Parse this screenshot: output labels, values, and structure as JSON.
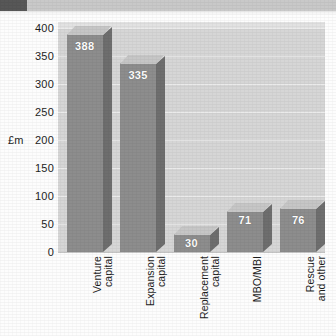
{
  "scan": {
    "band_present": true,
    "band_dark_swatch": "#575757",
    "band_light_swatch": "#c9c9c9"
  },
  "colors": {
    "bar_front": "#8d8d8d",
    "bar_top": "#c6c6c6",
    "bar_side": "#6e6e6e",
    "plot_background": "#d6d6d6",
    "gridline": "#ebebeb",
    "text": "#1d1d1d",
    "value_label": "#ffffff"
  },
  "chart_data": {
    "type": "bar",
    "title": "",
    "subtitle": "",
    "xlabel": "",
    "ylabel": "£m",
    "categories": [
      "Venture\ncapital",
      "Expansion\ncapital",
      "Replacement\ncapital",
      "MBO/MBI",
      "Rescue\nand other"
    ],
    "values": [
      388,
      335,
      30,
      71,
      76
    ],
    "value_labels": [
      "388",
      "335",
      "30",
      "71",
      "76"
    ],
    "ylim": [
      0,
      400
    ],
    "ytick_values": [
      0,
      50,
      100,
      150,
      200,
      250,
      300,
      350,
      400
    ],
    "ytick_labels": [
      "0",
      "50",
      "100",
      "150",
      "200",
      "250",
      "300",
      "350",
      "400"
    ],
    "grid": true,
    "grid_axis": "y",
    "legend": false,
    "legend_position": "none",
    "three_d": true,
    "orientation": "vertical"
  }
}
